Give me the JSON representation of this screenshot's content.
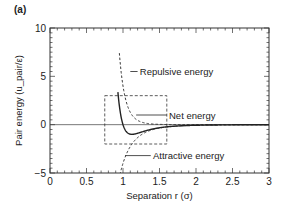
{
  "panel_label": "(a)",
  "chart_data": {
    "type": "line",
    "title": "",
    "xlabel": "Separation r (σ)",
    "ylabel": "Pair energy (u_pair/ε)",
    "xlim": [
      0,
      3
    ],
    "ylim": [
      -5,
      10
    ],
    "x_ticks": [
      0,
      0.5,
      1,
      1.5,
      2,
      2.5,
      3
    ],
    "x_tick_labels": [
      "0",
      "0.5",
      "1",
      "1.5",
      "2",
      "2.5",
      "3"
    ],
    "y_ticks": [
      -5,
      0,
      5,
      10
    ],
    "y_tick_labels": [
      "−5",
      "0",
      "5",
      "10"
    ],
    "grid": false,
    "series": [
      {
        "name": "Net energy",
        "style": "solid",
        "x": [
          0.95,
          1.0,
          1.05,
          1.1,
          1.122,
          1.2,
          1.3,
          1.4,
          1.5,
          1.75,
          2.0,
          2.5,
          3.0
        ],
        "y": [
          10,
          0,
          -0.88,
          -0.99,
          -1.0,
          -0.94,
          -0.77,
          -0.59,
          -0.45,
          -0.24,
          -0.12,
          -0.03,
          -0.01
        ]
      },
      {
        "name": "Repulsive energy",
        "style": "dashed",
        "x": [
          1.05,
          1.1,
          1.2,
          1.3,
          1.4,
          1.5,
          1.75,
          2.0,
          3.0
        ],
        "y": [
          10,
          4.1,
          1.79,
          0.78,
          0.35,
          0.16,
          0.03,
          0.0,
          0.0
        ]
      },
      {
        "name": "Attractive energy",
        "style": "dashed",
        "x": [
          0.9,
          1.0,
          1.1,
          1.2,
          1.3,
          1.4,
          1.5,
          1.75,
          2.0,
          3.0
        ],
        "y": [
          -5,
          -4.0,
          -2.26,
          -1.34,
          -0.83,
          -0.53,
          -0.35,
          -0.14,
          -0.06,
          -0.01
        ]
      }
    ],
    "annotations": [
      {
        "text": "Repulsive energy",
        "x": 1.1,
        "y": 5.5
      },
      {
        "text": "Net energy",
        "x": 1.6,
        "y": 1.0
      },
      {
        "text": "Attractive energy",
        "x": 1.25,
        "y": -3.2
      }
    ],
    "inset_box": {
      "x0": 0.75,
      "x1": 1.6,
      "y0": -2,
      "y1": 3,
      "style": "dashed"
    }
  }
}
